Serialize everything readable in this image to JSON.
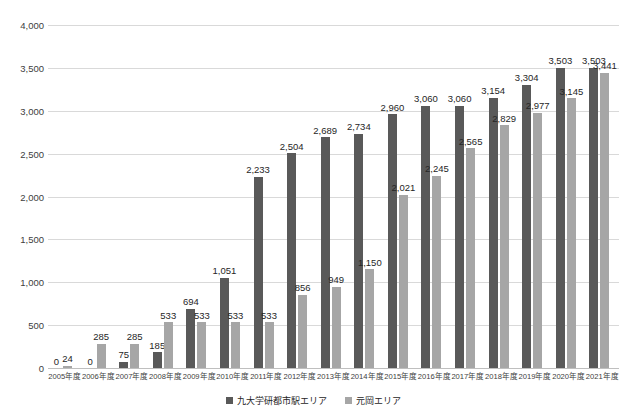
{
  "chart_data": {
    "type": "bar",
    "title": "",
    "xlabel": "",
    "ylabel": "",
    "ylim": [
      0,
      4000
    ],
    "ytick_labels": [
      "0",
      "500",
      "1,000",
      "1,500",
      "2,000",
      "2,500",
      "3,000",
      "3,500",
      "4,000"
    ],
    "ytick_values": [
      0,
      500,
      1000,
      1500,
      2000,
      2500,
      3000,
      3500,
      4000
    ],
    "grid": true,
    "legend_position": "bottom",
    "categories": [
      "2005年度",
      "2006年度",
      "2007年度",
      "2008年度",
      "2009年度",
      "2010年度",
      "2011年度",
      "2012年度",
      "2013年度",
      "2014年度",
      "2015年度",
      "2016年度",
      "2017年度",
      "2018年度",
      "2019年度",
      "2020年度",
      "2021年度"
    ],
    "series": [
      {
        "name": "九大学研都市駅エリア",
        "color": "#595959",
        "values": [
          0,
          0,
          75,
          185,
          694,
          1051,
          2233,
          2504,
          2689,
          2734,
          2960,
          3060,
          3060,
          3154,
          3304,
          3503,
          3503
        ],
        "labels": [
          "0",
          "0",
          "75",
          "185",
          "694",
          "1,051",
          "2,233",
          "2,504",
          "2,689",
          "2,734",
          "2,960",
          "3,060",
          "3,060",
          "3,154",
          "3,304",
          "3,503",
          "3,503"
        ]
      },
      {
        "name": "元岡エリア",
        "color": "#a6a6a6",
        "values": [
          24,
          285,
          285,
          533,
          533,
          533,
          533,
          856,
          949,
          1150,
          2021,
          2245,
          2565,
          2829,
          2977,
          3145,
          3441
        ],
        "labels": [
          "24",
          "285",
          "285",
          "533",
          "533",
          "533",
          "533",
          "856",
          "949",
          "1,150",
          "2,021",
          "2,245",
          "2,565",
          "2,829",
          "2,977",
          "3,145",
          "3,441"
        ]
      }
    ]
  }
}
